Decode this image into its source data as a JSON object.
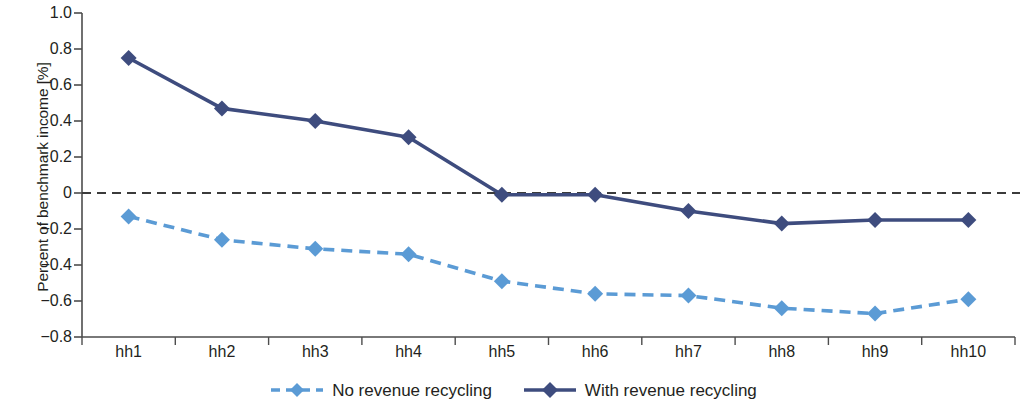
{
  "chart_data": {
    "type": "line",
    "title": "",
    "xlabel": "",
    "ylabel": "Percent of benchmark income [%]",
    "categories": [
      "hh1",
      "hh2",
      "hh3",
      "hh4",
      "hh5",
      "hh6",
      "hh7",
      "hh8",
      "hh9",
      "hh10"
    ],
    "ylim": [
      -0.8,
      1.0
    ],
    "yticks": [
      1.0,
      0.8,
      0.6,
      0.4,
      0.2,
      0,
      -0.2,
      -0.4,
      -0.6,
      -0.8
    ],
    "ytick_labels": [
      "1.0",
      "0.8",
      "0.6",
      "0.4",
      "0.2",
      "0",
      "−0.2",
      "−0.4",
      "−0.6",
      "−0.8"
    ],
    "grid": false,
    "zero_line": {
      "value": 0,
      "style": "dashed",
      "color": "#3b3b3b"
    },
    "legend_position": "bottom",
    "series": [
      {
        "name": "No revenue recycling",
        "color": "#5b9bd5",
        "line_style": "dashed",
        "marker": "diamond",
        "values": [
          -0.13,
          -0.26,
          -0.31,
          -0.34,
          -0.49,
          -0.56,
          -0.57,
          -0.64,
          -0.67,
          -0.59
        ]
      },
      {
        "name": "With revenue recycling",
        "color": "#3e4c7e",
        "line_style": "solid",
        "marker": "diamond",
        "values": [
          0.75,
          0.47,
          0.4,
          0.31,
          -0.01,
          -0.01,
          -0.1,
          -0.17,
          -0.15,
          -0.15
        ]
      }
    ]
  },
  "axes": {
    "y_axis_title": "Percent of benchmark income [%]"
  }
}
